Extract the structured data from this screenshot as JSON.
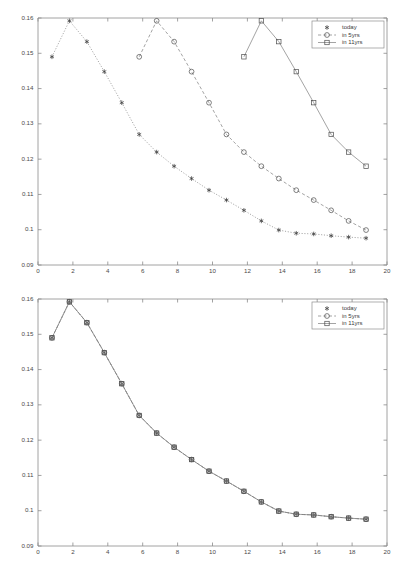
{
  "figure": {
    "background": "#ffffff",
    "line_color": "#7d7d7d",
    "marker_color": "#4d4d4d",
    "axis_color": "#8a8a8a"
  },
  "legend": {
    "position": "top-right",
    "entries": [
      {
        "label": "today",
        "marker": "asterisk-marker",
        "linestyle": "dotted"
      },
      {
        "label": "in 5yrs",
        "marker": "circle-marker",
        "linestyle": "dashed"
      },
      {
        "label": "in 11yrs",
        "marker": "square-marker",
        "linestyle": "solid"
      }
    ]
  },
  "chart_data": [
    {
      "id": "top-chart",
      "type": "line",
      "title": "",
      "xlabel": "",
      "ylabel": "",
      "xlim": [
        0,
        20
      ],
      "ylim": [
        0.09,
        0.16
      ],
      "xticks": [
        0,
        2,
        4,
        6,
        8,
        10,
        12,
        14,
        16,
        18,
        20
      ],
      "yticks": [
        0.09,
        0.1,
        0.11,
        0.12,
        0.13,
        0.14,
        0.15,
        0.16
      ],
      "xticklabels": [
        "0",
        "2",
        "4",
        "6",
        "8",
        "10",
        "12",
        "14",
        "16",
        "18",
        "20"
      ],
      "yticklabels": [
        "0.09",
        "0.1",
        "0.11",
        "0.12",
        "0.13",
        "0.14",
        "0.15",
        "0.16"
      ],
      "grid": false,
      "legend": [
        "today",
        "in 5yrs",
        "in 11yrs"
      ],
      "series": [
        {
          "name": "today",
          "marker": "asterisk-marker",
          "linestyle": "dotted",
          "x": [
            0.8,
            1.8,
            2.8,
            3.8,
            4.8,
            5.8,
            6.8,
            7.8,
            8.8,
            9.8,
            10.8,
            11.8,
            12.8,
            13.8,
            14.8,
            15.8,
            16.8,
            17.8,
            18.8
          ],
          "y": [
            0.149,
            0.1592,
            0.1533,
            0.1448,
            0.136,
            0.127,
            0.122,
            0.118,
            0.1145,
            0.1112,
            0.1084,
            0.1055,
            0.1025,
            0.0999,
            0.099,
            0.0988,
            0.0983,
            0.0979,
            0.0976
          ]
        },
        {
          "name": "in 5yrs",
          "marker": "circle-marker",
          "linestyle": "dashed",
          "x": [
            5.8,
            6.8,
            7.8,
            8.8,
            9.8,
            10.8,
            11.8,
            12.8,
            13.8,
            14.8,
            15.8,
            16.8,
            17.8,
            18.8
          ],
          "y": [
            0.149,
            0.1592,
            0.1533,
            0.1448,
            0.136,
            0.127,
            0.122,
            0.118,
            0.1145,
            0.1112,
            0.1084,
            0.1055,
            0.1025,
            0.0999
          ]
        },
        {
          "name": "in 11yrs",
          "marker": "square-marker",
          "linestyle": "solid",
          "x": [
            11.8,
            12.8,
            13.8,
            14.8,
            15.8,
            16.8,
            17.8,
            18.8
          ],
          "y": [
            0.149,
            0.1592,
            0.1533,
            0.1448,
            0.136,
            0.127,
            0.122,
            0.118
          ]
        }
      ]
    },
    {
      "id": "bottom-chart",
      "type": "line",
      "title": "",
      "xlabel": "",
      "ylabel": "",
      "xlim": [
        0,
        20
      ],
      "ylim": [
        0.09,
        0.16
      ],
      "xticks": [
        0,
        2,
        4,
        6,
        8,
        10,
        12,
        14,
        16,
        18,
        20
      ],
      "yticks": [
        0.09,
        0.1,
        0.11,
        0.12,
        0.13,
        0.14,
        0.15,
        0.16
      ],
      "xticklabels": [
        "0",
        "2",
        "4",
        "6",
        "8",
        "10",
        "12",
        "14",
        "16",
        "18",
        "20"
      ],
      "yticklabels": [
        "0.09",
        "0.1",
        "0.11",
        "0.12",
        "0.13",
        "0.14",
        "0.15",
        "0.16"
      ],
      "grid": false,
      "legend": [
        "today",
        "in 5yrs",
        "in 11yrs"
      ],
      "note": "all three series coincide on the same curve",
      "series": [
        {
          "name": "today",
          "marker": "asterisk-marker",
          "linestyle": "dotted",
          "x": [
            0.8,
            1.8,
            2.8,
            3.8,
            4.8,
            5.8,
            6.8,
            7.8,
            8.8,
            9.8,
            10.8,
            11.8,
            12.8,
            13.8,
            14.8,
            15.8,
            16.8,
            17.8,
            18.8
          ],
          "y": [
            0.149,
            0.1592,
            0.1533,
            0.1448,
            0.136,
            0.127,
            0.122,
            0.118,
            0.1145,
            0.1112,
            0.1084,
            0.1055,
            0.1025,
            0.0999,
            0.099,
            0.0988,
            0.0983,
            0.0979,
            0.0976
          ]
        },
        {
          "name": "in 5yrs",
          "marker": "circle-marker",
          "linestyle": "dashed",
          "x": [
            0.8,
            1.8,
            2.8,
            3.8,
            4.8,
            5.8,
            6.8,
            7.8,
            8.8,
            9.8,
            10.8,
            11.8,
            12.8,
            13.8,
            14.8,
            15.8,
            16.8,
            17.8,
            18.8
          ],
          "y": [
            0.149,
            0.1592,
            0.1533,
            0.1448,
            0.136,
            0.127,
            0.122,
            0.118,
            0.1145,
            0.1112,
            0.1084,
            0.1055,
            0.1025,
            0.0999,
            0.099,
            0.0988,
            0.0983,
            0.0979,
            0.0976
          ]
        },
        {
          "name": "in 11yrs",
          "marker": "square-marker",
          "linestyle": "solid",
          "x": [
            0.8,
            1.8,
            2.8,
            3.8,
            4.8,
            5.8,
            6.8,
            7.8,
            8.8,
            9.8,
            10.8,
            11.8,
            12.8,
            13.8,
            14.8,
            15.8,
            16.8,
            17.8,
            18.8
          ],
          "y": [
            0.149,
            0.1592,
            0.1533,
            0.1448,
            0.136,
            0.127,
            0.122,
            0.118,
            0.1145,
            0.1112,
            0.1084,
            0.1055,
            0.1025,
            0.0999,
            0.099,
            0.0988,
            0.0983,
            0.0979,
            0.0976
          ]
        }
      ]
    }
  ]
}
